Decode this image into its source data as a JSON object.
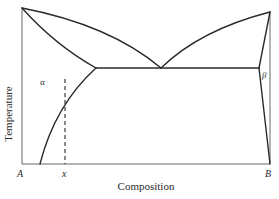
{
  "diagram": {
    "type": "binary eutectic phase diagram",
    "axes": {
      "y_label": "Temperature",
      "x_label": "Composition",
      "x_ticks": {
        "left": "A",
        "marker": "x",
        "right": "B"
      }
    },
    "phase_labels": {
      "alpha": "α",
      "beta": "β"
    },
    "colors": {
      "line": "#2a2a2a",
      "axis": "#555555",
      "background": "#ffffff"
    }
  }
}
